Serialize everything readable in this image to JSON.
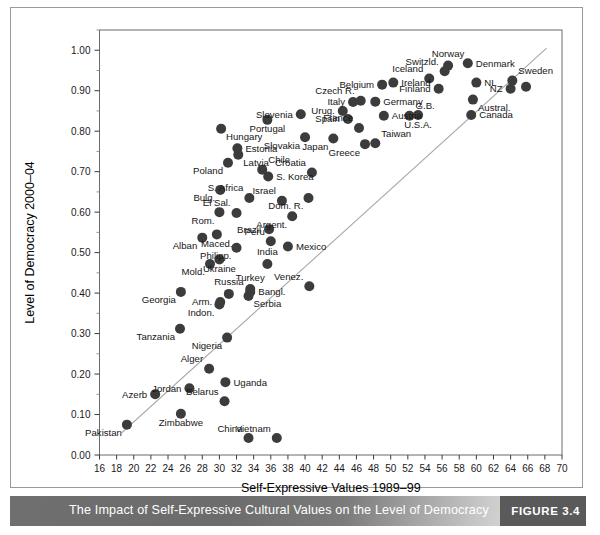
{
  "caption": {
    "title": "The Impact of Self-Expressive Cultural Values on the Level of Democracy",
    "figure_number": "FIGURE 3.4"
  },
  "chart_data": {
    "type": "scatter",
    "title": "The Impact of Self-Expressive Cultural Values on the Level of Democracy",
    "xlabel": "Self-Expressive Values 1989–99",
    "ylabel": "Level of Democracy 2000–04",
    "xlim": [
      16,
      70
    ],
    "ylim": [
      0.0,
      1.05
    ],
    "xticks": [
      16,
      18,
      20,
      22,
      24,
      26,
      28,
      30,
      32,
      34,
      36,
      38,
      40,
      42,
      44,
      46,
      48,
      50,
      52,
      54,
      56,
      58,
      60,
      62,
      64,
      66,
      68,
      70
    ],
    "xtick_labels": [
      "16",
      "18",
      "20",
      "22",
      "24",
      "26",
      "28",
      "30",
      "32",
      "34",
      "36",
      "38",
      "40",
      "42",
      "44",
      "46",
      "48",
      "50",
      "52",
      "54",
      "56",
      "58",
      "60",
      "62",
      "64",
      "66",
      "68",
      "70"
    ],
    "yticks": [
      0.0,
      0.1,
      0.2,
      0.3,
      0.4,
      0.5,
      0.6,
      0.7,
      0.8,
      0.9,
      1.0
    ],
    "ytick_labels": [
      "0.00",
      "0.10",
      "0.20",
      "0.30",
      "0.40",
      "0.50",
      "0.60",
      "0.70",
      "0.80",
      "0.90",
      "1.00"
    ],
    "yminor_ticks": [
      0.05,
      0.15,
      0.25,
      0.35,
      0.45,
      0.55,
      0.65,
      0.75,
      0.85,
      0.95,
      1.05
    ],
    "grid": false,
    "legend": null,
    "marker_color": "#3c3c3c",
    "trendline": {
      "type": "linear-fit",
      "color": "#a8a8a8",
      "x": [
        18.6,
        68.2
      ],
      "y": [
        0.055,
        1.005
      ]
    },
    "points": [
      {
        "label": "Pakistan",
        "x": 19.2,
        "y": 0.075,
        "label_pos": "below-left"
      },
      {
        "label": "Azerb",
        "x": 22.5,
        "y": 0.15,
        "label_pos": "left"
      },
      {
        "label": "Zimbabwe",
        "x": 25.5,
        "y": 0.102,
        "label_pos": "below"
      },
      {
        "label": "Tanzania",
        "x": 25.4,
        "y": 0.312,
        "label_pos": "below-left"
      },
      {
        "label": "Georgia",
        "x": 25.5,
        "y": 0.403,
        "label_pos": "below-left"
      },
      {
        "label": "Jordan",
        "x": 26.5,
        "y": 0.165,
        "label_pos": "left"
      },
      {
        "label": "Alger",
        "x": 28.8,
        "y": 0.213,
        "label_pos": "above-left"
      },
      {
        "label": "Uganda",
        "x": 30.7,
        "y": 0.18,
        "label_pos": "right"
      },
      {
        "label": "Belarus",
        "x": 30.6,
        "y": 0.133,
        "label_pos": "above-left"
      },
      {
        "label": "Nigeria",
        "x": 30.9,
        "y": 0.29,
        "label_pos": "below-left"
      },
      {
        "label": "China",
        "x": 33.4,
        "y": 0.042,
        "label_pos": "above-left"
      },
      {
        "label": "Vietnam",
        "x": 36.7,
        "y": 0.042,
        "label_pos": "above-left"
      },
      {
        "label": "Indon.",
        "x": 30.0,
        "y": 0.372,
        "label_pos": "below-left"
      },
      {
        "label": "Arm.",
        "x": 30.1,
        "y": 0.378,
        "label_pos": "left"
      },
      {
        "label": "Russia",
        "x": 31.1,
        "y": 0.398,
        "label_pos": "above"
      },
      {
        "label": "Serbia",
        "x": 33.4,
        "y": 0.393,
        "label_pos": "below-right"
      },
      {
        "label": "Bangl.",
        "x": 33.6,
        "y": 0.403,
        "label_pos": "right"
      },
      {
        "label": "Turkey",
        "x": 33.6,
        "y": 0.41,
        "label_pos": "above"
      },
      {
        "label": "Venez.",
        "x": 40.5,
        "y": 0.417,
        "label_pos": "above-left"
      },
      {
        "label": "Mold.",
        "x": 28.9,
        "y": 0.472,
        "label_pos": "below-left"
      },
      {
        "label": "Ukraine",
        "x": 30.0,
        "y": 0.483,
        "label_pos": "below"
      },
      {
        "label": "India",
        "x": 35.6,
        "y": 0.472,
        "label_pos": "above"
      },
      {
        "label": "Alban",
        "x": 28.0,
        "y": 0.537,
        "label_pos": "below-left"
      },
      {
        "label": "Maced.",
        "x": 29.7,
        "y": 0.545,
        "label_pos": "below"
      },
      {
        "label": "Philipp.",
        "x": 32.0,
        "y": 0.512,
        "label_pos": "below-left"
      },
      {
        "label": "Rom.",
        "x": 30.0,
        "y": 0.6,
        "label_pos": "below-left"
      },
      {
        "label": "El Sal.",
        "x": 32.0,
        "y": 0.598,
        "label_pos": "above-left"
      },
      {
        "label": "Bulg.",
        "x": 30.1,
        "y": 0.655,
        "label_pos": "below-left"
      },
      {
        "label": "S. Africa",
        "x": 33.5,
        "y": 0.635,
        "label_pos": "above-left"
      },
      {
        "label": "Brazil",
        "x": 35.8,
        "y": 0.558,
        "label_pos": "left"
      },
      {
        "label": "Peru",
        "x": 36.0,
        "y": 0.528,
        "label_pos": "above-left"
      },
      {
        "label": "Mexico",
        "x": 38.0,
        "y": 0.515,
        "label_pos": "right"
      },
      {
        "label": "Argent.",
        "x": 38.5,
        "y": 0.59,
        "label_pos": "below-left"
      },
      {
        "label": "Israel",
        "x": 37.3,
        "y": 0.628,
        "label_pos": "above-left"
      },
      {
        "label": "S. Korea",
        "x": 35.7,
        "y": 0.688,
        "label_pos": "right"
      },
      {
        "label": "Dom. R.",
        "x": 40.4,
        "y": 0.635,
        "label_pos": "below-left"
      },
      {
        "label": "Poland",
        "x": 31.0,
        "y": 0.722,
        "label_pos": "below-left"
      },
      {
        "label": "Latvia",
        "x": 32.2,
        "y": 0.742,
        "label_pos": "below-right"
      },
      {
        "label": "Estonia",
        "x": 32.1,
        "y": 0.758,
        "label_pos": "right"
      },
      {
        "label": "Hungary",
        "x": 30.2,
        "y": 0.806,
        "label_pos": "below-right"
      },
      {
        "label": "Chile",
        "x": 35.0,
        "y": 0.705,
        "label_pos": "above-right"
      },
      {
        "label": "Croatia",
        "x": 40.8,
        "y": 0.698,
        "label_pos": "above-left"
      },
      {
        "label": "Portugal",
        "x": 35.6,
        "y": 0.828,
        "label_pos": "below"
      },
      {
        "label": "Slovenia",
        "x": 39.5,
        "y": 0.842,
        "label_pos": "left"
      },
      {
        "label": "Slovakia",
        "x": 40.0,
        "y": 0.785,
        "label_pos": "below-left"
      },
      {
        "label": "Japan",
        "x": 43.3,
        "y": 0.782,
        "label_pos": "below-left"
      },
      {
        "label": "Spain",
        "x": 45.0,
        "y": 0.83,
        "label_pos": "left"
      },
      {
        "label": "Urug.",
        "x": 44.4,
        "y": 0.85,
        "label_pos": "left"
      },
      {
        "label": "Italy",
        "x": 45.6,
        "y": 0.872,
        "label_pos": "left"
      },
      {
        "label": "Czech R.",
        "x": 46.5,
        "y": 0.875,
        "label_pos": "above-left"
      },
      {
        "label": "Greece",
        "x": 47.0,
        "y": 0.768,
        "label_pos": "below-left"
      },
      {
        "label": "Taiwan",
        "x": 48.2,
        "y": 0.77,
        "label_pos": "above-right"
      },
      {
        "label": "France",
        "x": 46.3,
        "y": 0.808,
        "label_pos": "above-left"
      },
      {
        "label": "Germany",
        "x": 48.2,
        "y": 0.873,
        "label_pos": "right"
      },
      {
        "label": "Austria",
        "x": 49.2,
        "y": 0.838,
        "label_pos": "right"
      },
      {
        "label": "Belgium",
        "x": 49.0,
        "y": 0.915,
        "label_pos": "left"
      },
      {
        "label": "Ireland",
        "x": 50.3,
        "y": 0.92,
        "label_pos": "right"
      },
      {
        "label": "Iceland",
        "x": 54.5,
        "y": 0.93,
        "label_pos": "above-left"
      },
      {
        "label": "Finland",
        "x": 55.6,
        "y": 0.905,
        "label_pos": "left"
      },
      {
        "label": "Switzld.",
        "x": 56.3,
        "y": 0.948,
        "label_pos": "above-left"
      },
      {
        "label": "Norway",
        "x": 56.7,
        "y": 0.962,
        "label_pos": "above"
      },
      {
        "label": "Denmark",
        "x": 59.0,
        "y": 0.968,
        "label_pos": "right"
      },
      {
        "label": "G.B.",
        "x": 52.2,
        "y": 0.838,
        "label_pos": "above-right"
      },
      {
        "label": "U.S.A.",
        "x": 53.2,
        "y": 0.84,
        "label_pos": "below"
      },
      {
        "label": "NL",
        "x": 60.0,
        "y": 0.92,
        "label_pos": "right"
      },
      {
        "label": "Austral.",
        "x": 59.6,
        "y": 0.878,
        "label_pos": "below-right"
      },
      {
        "label": "Canada",
        "x": 59.4,
        "y": 0.84,
        "label_pos": "right"
      },
      {
        "label": "NZ",
        "x": 64.0,
        "y": 0.905,
        "label_pos": "left"
      },
      {
        "label": "Sweden",
        "x": 64.2,
        "y": 0.925,
        "label_pos": "above-right"
      },
      {
        "label": "Sweden2",
        "x": 65.8,
        "y": 0.91,
        "label_pos": "none"
      }
    ]
  }
}
